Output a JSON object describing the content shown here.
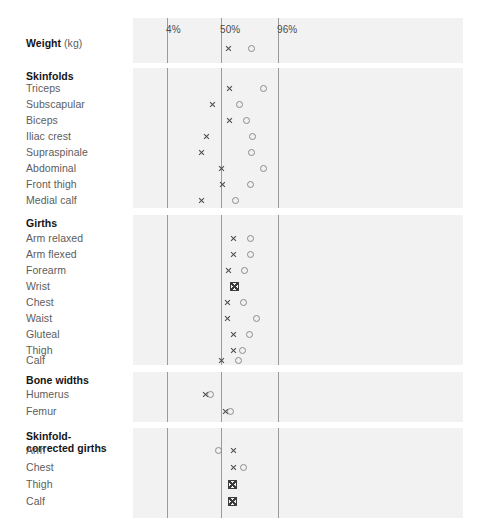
{
  "chart_data": {
    "type": "scatter",
    "title": "",
    "xlabel": "",
    "ylabel": "",
    "grid": true,
    "legend_position": "none",
    "axis": {
      "ticks": [
        {
          "label": "4%",
          "value": 4,
          "x": 167
        },
        {
          "label": "50%",
          "value": 50,
          "x": 221
        },
        {
          "label": "96%",
          "value": 96,
          "x": 278
        }
      ],
      "xlim": [
        0,
        100
      ],
      "plot_left_px": 133,
      "plot_right_px": 463
    },
    "series": [
      {
        "name": "x",
        "marker": "x",
        "color": "#4a4a4a"
      },
      {
        "name": "o",
        "marker": "o",
        "color": "#8b8b8b"
      }
    ],
    "groups": [
      {
        "id": "weight",
        "heading": "Weight",
        "heading_unit": "(kg)",
        "heading_two_line": false,
        "panel": {
          "top": 18,
          "height": 45
        },
        "rows": [
          {
            "label": "",
            "y": 48,
            "points": [
              {
                "series": "x",
                "x": 228
              },
              {
                "series": "o",
                "x": 251
              }
            ]
          }
        ]
      },
      {
        "id": "skinfolds",
        "heading": "Skinfolds",
        "heading_unit": "",
        "heading_two_line": false,
        "panel": {
          "top": 68,
          "height": 140
        },
        "rows": [
          {
            "label": "Triceps",
            "y": 88,
            "points": [
              {
                "series": "x",
                "x": 229
              },
              {
                "series": "o",
                "x": 263
              }
            ]
          },
          {
            "label": "Subscapular",
            "y": 104,
            "points": [
              {
                "series": "x",
                "x": 212
              },
              {
                "series": "o",
                "x": 239
              }
            ]
          },
          {
            "label": "Biceps",
            "y": 120,
            "points": [
              {
                "series": "x",
                "x": 229
              },
              {
                "series": "o",
                "x": 246
              }
            ]
          },
          {
            "label": "Iliac crest",
            "y": 136,
            "points": [
              {
                "series": "x",
                "x": 206
              },
              {
                "series": "o",
                "x": 252
              }
            ]
          },
          {
            "label": "Supraspinale",
            "y": 152,
            "points": [
              {
                "series": "x",
                "x": 201
              },
              {
                "series": "o",
                "x": 251
              }
            ]
          },
          {
            "label": "Abdominal",
            "y": 168,
            "points": [
              {
                "series": "x",
                "x": 221
              },
              {
                "series": "o",
                "x": 263
              }
            ]
          },
          {
            "label": "Front thigh",
            "y": 184,
            "points": [
              {
                "series": "x",
                "x": 222
              },
              {
                "series": "o",
                "x": 250
              }
            ]
          },
          {
            "label": "Medial calf",
            "y": 200,
            "points": [
              {
                "series": "x",
                "x": 201
              },
              {
                "series": "o",
                "x": 235
              }
            ]
          }
        ]
      },
      {
        "id": "girths",
        "heading": "Girths",
        "heading_unit": "",
        "heading_two_line": false,
        "panel": {
          "top": 215,
          "height": 150
        },
        "rows": [
          {
            "label": "Arm relaxed",
            "y": 238,
            "points": [
              {
                "series": "x",
                "x": 233
              },
              {
                "series": "o",
                "x": 250
              }
            ]
          },
          {
            "label": "Arm flexed",
            "y": 254,
            "points": [
              {
                "series": "x",
                "x": 233
              },
              {
                "series": "o",
                "x": 250
              }
            ]
          },
          {
            "label": "Forearm",
            "y": 270,
            "points": [
              {
                "series": "x",
                "x": 228
              },
              {
                "series": "o",
                "x": 244
              }
            ]
          },
          {
            "label": "Wrist",
            "y": 286,
            "points": [
              {
                "series": "xo",
                "x": 234
              }
            ]
          },
          {
            "label": "Chest",
            "y": 302,
            "points": [
              {
                "series": "x",
                "x": 227
              },
              {
                "series": "o",
                "x": 243
              }
            ]
          },
          {
            "label": "Waist",
            "y": 318,
            "points": [
              {
                "series": "x",
                "x": 227
              },
              {
                "series": "o",
                "x": 256
              }
            ]
          },
          {
            "label": "Gluteal",
            "y": 334,
            "points": [
              {
                "series": "x",
                "x": 233
              },
              {
                "series": "o",
                "x": 249
              }
            ]
          },
          {
            "label": "Thigh",
            "y": 350,
            "points": [
              {
                "series": "x",
                "x": 233
              },
              {
                "series": "o",
                "x": 242
              }
            ]
          },
          {
            "label": "Calf",
            "y": 360,
            "points": [
              {
                "series": "x",
                "x": 221
              },
              {
                "series": "o",
                "x": 238
              }
            ]
          }
        ]
      },
      {
        "id": "bone-widths",
        "heading": "Bone widths",
        "heading_unit": "",
        "heading_two_line": false,
        "panel": {
          "top": 372,
          "height": 50
        },
        "rows": [
          {
            "label": "Humerus",
            "y": 394,
            "points": [
              {
                "series": "x",
                "x": 205
              },
              {
                "series": "o",
                "x": 210
              }
            ]
          },
          {
            "label": "Femur",
            "y": 411,
            "points": [
              {
                "series": "x",
                "x": 225
              },
              {
                "series": "o",
                "x": 230
              }
            ]
          }
        ]
      },
      {
        "id": "skinfold-corrected-girths",
        "heading": "Skinfold-",
        "heading_line2": "corrected girths",
        "heading_unit": "",
        "heading_two_line": true,
        "panel": {
          "top": 428,
          "height": 90
        },
        "rows": [
          {
            "label": "Arm",
            "y": 450,
            "points": [
              {
                "series": "o",
                "x": 218
              },
              {
                "series": "x",
                "x": 233
              }
            ]
          },
          {
            "label": "Chest",
            "y": 467,
            "points": [
              {
                "series": "x",
                "x": 233
              },
              {
                "series": "o",
                "x": 243
              }
            ]
          },
          {
            "label": "Thigh",
            "y": 484,
            "points": [
              {
                "series": "xo",
                "x": 232
              }
            ]
          },
          {
            "label": "Calf",
            "y": 501,
            "points": [
              {
                "series": "xo",
                "x": 232
              }
            ]
          }
        ]
      }
    ],
    "label_rows": [
      {
        "text": "Weight",
        "y": 45,
        "bold": true,
        "unit": "(kg)"
      },
      {
        "text": "Skinfolds",
        "y": 76,
        "bold": true,
        "unit": ""
      },
      {
        "text": "Triceps",
        "y": 87,
        "bold": false,
        "unit": ""
      },
      {
        "text": "Subscapular",
        "y": 104,
        "bold": false,
        "unit": ""
      },
      {
        "text": "Biceps",
        "y": 120,
        "bold": false,
        "unit": ""
      },
      {
        "text": "Iliac crest",
        "y": 136,
        "bold": false,
        "unit": ""
      },
      {
        "text": "Supraspinale",
        "y": 152,
        "bold": false,
        "unit": ""
      },
      {
        "text": "Abdominal",
        "y": 169,
        "bold": false,
        "unit": ""
      },
      {
        "text": "Front thigh",
        "y": 185,
        "bold": false,
        "unit": ""
      },
      {
        "text": "Medial calf",
        "y": 201,
        "bold": false,
        "unit": ""
      },
      {
        "text": "Girths",
        "y": 226,
        "bold": true,
        "unit": ""
      },
      {
        "text": "Arm relaxed",
        "y": 238,
        "bold": false,
        "unit": ""
      },
      {
        "text": "Arm flexed",
        "y": 254,
        "bold": false,
        "unit": ""
      },
      {
        "text": "Forearm",
        "y": 270,
        "bold": false,
        "unit": ""
      },
      {
        "text": "Wrist",
        "y": 286,
        "bold": false,
        "unit": ""
      },
      {
        "text": "Chest",
        "y": 302,
        "bold": false,
        "unit": ""
      },
      {
        "text": "Waist",
        "y": 318,
        "bold": false,
        "unit": ""
      },
      {
        "text": "Gluteal",
        "y": 334,
        "bold": false,
        "unit": ""
      },
      {
        "text": "Thigh",
        "y": 350,
        "bold": false,
        "unit": ""
      },
      {
        "text": "Calf",
        "y": 366,
        "bold": false,
        "unit": ""
      }
    ],
    "colors": {
      "panel_background": "#f2f2f2",
      "gridline": "#9a9a9a",
      "marker_x": "#4a4a4a",
      "marker_o": "#8b8b8b",
      "heading_text": "#151515",
      "row_text": "#5d5d5d",
      "tick_text": "#4b4b4b",
      "page_background": "#ffffff"
    }
  }
}
